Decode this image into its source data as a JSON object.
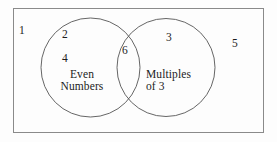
{
  "diagram": {
    "type": "venn-two-set",
    "colors": {
      "stroke": "#555555",
      "frame_stroke": "#8a8a8a",
      "text": "#1c1c1c",
      "background": "#fdfdfd"
    },
    "universe": {
      "name": "universal-set-rectangle",
      "elements_outside_all_sets": [
        "1",
        "5"
      ]
    },
    "sets": [
      {
        "id": "even-numbers",
        "label": "Even",
        "label_line2": "Numbers",
        "full_label": "Even Numbers",
        "elements_only": [
          "2",
          "4"
        ]
      },
      {
        "id": "multiples-of-3",
        "label": "Multiples",
        "label_line2": "of 3",
        "full_label": "Multiples of 3",
        "elements_only": [
          "3"
        ]
      }
    ],
    "intersection": {
      "id": "even-and-multiples-of-3",
      "elements": [
        "6"
      ]
    }
  },
  "labels": {
    "universe_one": "1",
    "even_two": "2",
    "even_four": "4",
    "intersection_six": "6",
    "multiples_three": "3",
    "outside_five": "5",
    "left_set_line1": "Even",
    "left_set_line2": "Numbers",
    "right_set_line1": "Multiples",
    "right_set_line2": "of 3"
  }
}
